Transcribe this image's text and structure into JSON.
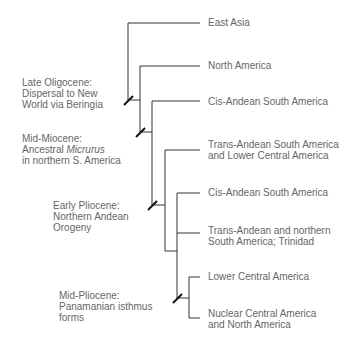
{
  "diagram": {
    "type": "phylogenetic-tree",
    "line_color": "#333333",
    "text_color": "#666666",
    "taxa": [
      {
        "label": "East Asia"
      },
      {
        "label": "North America"
      },
      {
        "label": "Cis-Andean South America"
      },
      {
        "label_line1": "Trans-Andean South America",
        "label_line2": "and Lower Central America"
      },
      {
        "label": "Cis-Andean South America"
      },
      {
        "label_line1": "Trans-Andean and northern",
        "label_line2": "South America; Trinidad"
      },
      {
        "label": "Lower Central America"
      },
      {
        "label_line1": "Nuclear Central America",
        "label_line2": "and North America"
      }
    ],
    "events": [
      {
        "line1": "Late Oligocene:",
        "line2": "Dispersal to New",
        "line3": "World via Beringia"
      },
      {
        "line1": "Mid-Miocene:",
        "line2_prefix": "Ancestral ",
        "line2_italic": "Micrurus",
        "line3": "in northern S. America"
      },
      {
        "line1": "Early Pliocene:",
        "line2": "Northern Andean",
        "line3": "Orogeny"
      },
      {
        "line1": "Mid-Pliocene:",
        "line2": "Panamanian isthmus",
        "line3": "forms"
      }
    ]
  }
}
